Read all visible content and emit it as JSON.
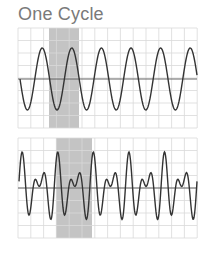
{
  "title": "One Cycle",
  "colors": {
    "grid": "#d9d9d9",
    "shade": "#c4c4c4",
    "wave": "#333333",
    "axis": "#555555",
    "title": "#7a7a7a"
  },
  "chart_data": [
    {
      "type": "line",
      "title": "One Cycle",
      "subtitle": "",
      "description": "Pure sine wave; shaded region marks one cycle",
      "xlabel": "",
      "ylabel": "",
      "grid": true,
      "legend": null,
      "frame": {
        "x0": 18,
        "x1": 197,
        "y0": 28,
        "y1": 128,
        "axis_y": 79,
        "amplitude_px": 31
      },
      "wave": {
        "kind": "sine",
        "start_x": 20,
        "period_px": 29.6,
        "phase": 3.14159,
        "harmonics": [
          [
            1,
            1.0,
            0
          ]
        ]
      },
      "cycles_shown": 6,
      "highlight": {
        "x_start": 49,
        "x_end": 79,
        "label": "one cycle"
      },
      "y_range": [
        -1,
        1
      ]
    },
    {
      "type": "line",
      "title": "",
      "subtitle": "",
      "description": "Complex periodic wave (sum of sines); shaded region marks one cycle",
      "xlabel": "",
      "ylabel": "",
      "grid": true,
      "legend": null,
      "frame": {
        "x0": 18,
        "x1": 197,
        "y0": 138,
        "y1": 238,
        "axis_y": 188,
        "amplitude_px": 36
      },
      "wave": {
        "kind": "sum",
        "start_x": 19,
        "period_px": 35.6,
        "phase": 0,
        "harmonics": [
          [
            2,
            0.62,
            0.35
          ],
          [
            3,
            0.55,
            0.0
          ]
        ]
      },
      "cycles_shown": 5,
      "highlight": {
        "x_start": 56,
        "x_end": 92,
        "label": "one cycle"
      },
      "y_range": [
        -1,
        1
      ]
    }
  ]
}
